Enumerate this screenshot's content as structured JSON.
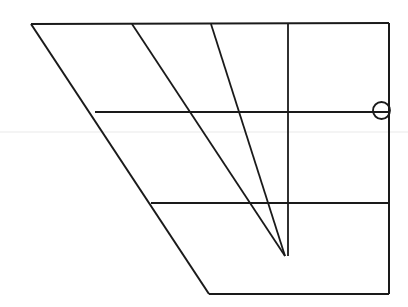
{
  "figure": {
    "canvas": {
      "width": 408,
      "height": 307,
      "background": "#ffffff"
    },
    "colors": {
      "stroke": "#1a1a1a",
      "faint_stroke": "#e9e9e9",
      "background": "#ffffff"
    },
    "stroke_widths": {
      "main": 2.0,
      "thin": 1.6,
      "faint": 1.0,
      "circle": 1.8
    }
  },
  "geometry": {
    "outline": {
      "name": "outer-quadrilateral",
      "points": "31,24 389,23 389,294 209,294",
      "closed": true
    },
    "lines": [
      {
        "name": "top-edge",
        "x1": 31,
        "y1": 24,
        "x2": 389,
        "y2": 23,
        "role": "outline-top",
        "width": 2.0
      },
      {
        "name": "right-edge",
        "x1": 389,
        "y1": 23,
        "x2": 389,
        "y2": 294,
        "role": "outline-right",
        "width": 2.0
      },
      {
        "name": "bottom-edge",
        "x1": 209,
        "y1": 294,
        "x2": 389,
        "y2": 294,
        "role": "outline-bottom",
        "width": 2.0
      },
      {
        "name": "left-slanted-edge",
        "x1": 31,
        "y1": 24,
        "x2": 209,
        "y2": 294,
        "role": "outline-left-diagonal",
        "width": 2.0
      },
      {
        "name": "diagonal-two",
        "x1": 132,
        "y1": 24,
        "x2": 285,
        "y2": 256,
        "role": "converging-diagonal",
        "width": 1.8
      },
      {
        "name": "diagonal-three",
        "x1": 211,
        "y1": 24,
        "x2": 285,
        "y2": 256,
        "role": "converging-diagonal",
        "width": 1.8
      },
      {
        "name": "vertical-rule",
        "x1": 288,
        "y1": 24,
        "x2": 288,
        "y2": 256,
        "role": "vertical-axis",
        "width": 1.8
      },
      {
        "name": "upper-horizontal-rule",
        "x1": 95,
        "y1": 112,
        "x2": 389,
        "y2": 112,
        "role": "horizontal-gridline",
        "width": 1.8
      },
      {
        "name": "lower-horizontal-rule",
        "x1": 151,
        "y1": 203,
        "x2": 389,
        "y2": 203,
        "role": "horizontal-gridline",
        "width": 1.8
      },
      {
        "name": "faint-horizon-line",
        "x1": 0,
        "y1": 132,
        "x2": 408,
        "y2": 132,
        "role": "faint-full-width-guide",
        "width": 1.0,
        "color": "#e9e9e9"
      }
    ],
    "nodes": [
      {
        "name": "right-edge-circle-node",
        "cx": 381.5,
        "cy": 110.5,
        "r": 8.5,
        "width": 1.8
      }
    ],
    "vertices": [
      {
        "name": "top-left-vertex",
        "x": 31,
        "y": 24
      },
      {
        "name": "top-right-vertex",
        "x": 389,
        "y": 23
      },
      {
        "name": "bottom-right-vertex",
        "x": 389,
        "y": 294
      },
      {
        "name": "bottom-left-vertex",
        "x": 209,
        "y": 294
      },
      {
        "name": "convergence-point",
        "x": 285,
        "y": 256
      }
    ]
  }
}
